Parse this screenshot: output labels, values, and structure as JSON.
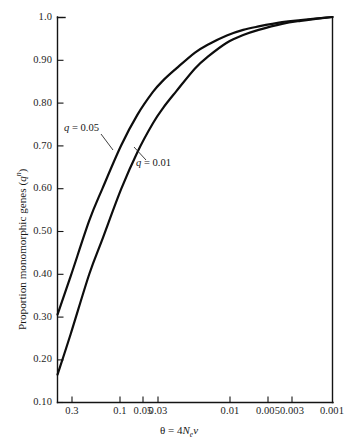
{
  "chart_data": {
    "type": "line",
    "title": "",
    "xlabel": "θ = 4Nₑν",
    "ylabel": "Proportion monomorphic genes (qⁿ)",
    "x_scale": "log-reversed",
    "x_ticks": [
      "0.3",
      "0.1",
      "0.05",
      "0.03",
      "0.01",
      "0.005",
      "0.003",
      "0.001"
    ],
    "x_tick_values": [
      0.3,
      0.1,
      0.05,
      0.03,
      0.01,
      0.005,
      0.003,
      0.001
    ],
    "y_ticks": [
      "1.0",
      "0.90",
      "0.80",
      "0.70",
      "0.60",
      "0.50",
      "0.40",
      "0.30",
      "0.20",
      "0.10"
    ],
    "y_tick_values": [
      1.0,
      0.9,
      0.8,
      0.7,
      0.6,
      0.5,
      0.4,
      0.3,
      0.2,
      0.1
    ],
    "ylim": [
      0.1,
      1.0
    ],
    "xlim": [
      0.4,
      0.001
    ],
    "grid": false,
    "legend": "inline-annotations",
    "series": [
      {
        "name": "q = 0.05",
        "label": "q = 0.05",
        "x": [
          0.4,
          0.3,
          0.2,
          0.15,
          0.1,
          0.07,
          0.05,
          0.04,
          0.03,
          0.02,
          0.015,
          0.01,
          0.007,
          0.005,
          0.003,
          0.002,
          0.001
        ],
        "y": [
          0.305,
          0.395,
          0.525,
          0.6,
          0.7,
          0.772,
          0.825,
          0.852,
          0.88,
          0.917,
          0.936,
          0.957,
          0.97,
          0.978,
          0.988,
          0.993,
          1.0
        ]
      },
      {
        "name": "q = 0.01",
        "label": "q = 0.01",
        "x": [
          0.4,
          0.3,
          0.2,
          0.15,
          0.1,
          0.07,
          0.05,
          0.04,
          0.03,
          0.02,
          0.015,
          0.01,
          0.007,
          0.005,
          0.003,
          0.002,
          0.001
        ],
        "y": [
          0.165,
          0.26,
          0.4,
          0.482,
          0.598,
          0.685,
          0.752,
          0.788,
          0.827,
          0.88,
          0.908,
          0.94,
          0.958,
          0.97,
          0.984,
          0.991,
          1.0
        ]
      }
    ],
    "annotations": [
      {
        "text": "q = 0.05",
        "target_series": "q = 0.05"
      },
      {
        "text": "q = 0.01",
        "target_series": "q = 0.01"
      }
    ]
  },
  "axis_titles": {
    "y_prefix": "Proportion monomorphic genes (",
    "y_var": "q",
    "y_sup": "n",
    "y_suffix": ")",
    "x_theta": "θ",
    "x_eq": " = 4",
    "x_n": "N",
    "x_sub": "e",
    "x_nu": "ν"
  },
  "series_labels": {
    "upper_var": "q",
    "upper_rest": " = 0.05",
    "lower_var": "q",
    "lower_rest": " = 0.01"
  },
  "ticks": {
    "y": [
      {
        "label": "1.0",
        "top": 11
      },
      {
        "label": "0.90",
        "top": 54
      },
      {
        "label": "0.80",
        "top": 97
      },
      {
        "label": "0.70",
        "top": 140
      },
      {
        "label": "0.60",
        "top": 182
      },
      {
        "label": "0.50",
        "top": 225
      },
      {
        "label": "0.40",
        "top": 268
      },
      {
        "label": "0.30",
        "top": 311
      },
      {
        "label": "0.20",
        "top": 353
      },
      {
        "label": "0.10",
        "top": 396
      }
    ],
    "x": [
      {
        "label": "0.3",
        "left": 72
      },
      {
        "label": "0.1",
        "left": 120
      },
      {
        "label": "0.05",
        "left": 143
      },
      {
        "label": "0.03",
        "left": 158
      },
      {
        "label": "0.01",
        "left": 230
      },
      {
        "label": "0.005",
        "left": 268
      },
      {
        "label": "0.003",
        "left": 292
      },
      {
        "label": "0.001",
        "left": 332
      }
    ]
  },
  "colors": {
    "background": "#ffffff",
    "axis": "#141414",
    "curve": "#0d0d0d",
    "text": "#1a1a1a"
  }
}
